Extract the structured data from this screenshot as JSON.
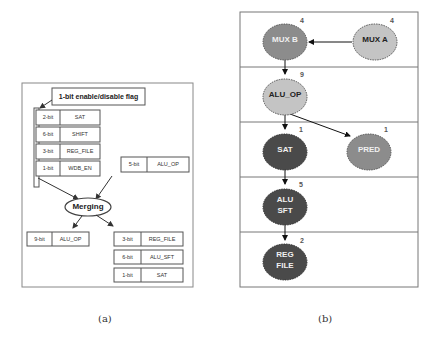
{
  "panel_a": {
    "caption": "(a)",
    "flag_label": "1-bit enable/disable flag",
    "inputs": [
      {
        "bits": "2-bit",
        "name": "SAT"
      },
      {
        "bits": "6-bit",
        "name": "SHIFT"
      },
      {
        "bits": "3-bit",
        "name": "REG_FILE"
      },
      {
        "bits": "1-bit",
        "name": "WDB_EN"
      }
    ],
    "side_input": {
      "bits": "5-bit",
      "name": "ALU_OP"
    },
    "merge_label": "Merging",
    "output_left": {
      "bits": "9-bit",
      "name": "ALU_OP"
    },
    "outputs_right": [
      {
        "bits": "3-bit",
        "name": "REG_FILE"
      },
      {
        "bits": "6-bit",
        "name": "ALU_SFT"
      },
      {
        "bits": "1-bit",
        "name": "SAT"
      }
    ]
  },
  "panel_b": {
    "caption": "(b)",
    "nodes": [
      {
        "id": "mux_b",
        "label": "MUX B",
        "weight": "4",
        "fill": "#8c8c8c",
        "text_color": "#f0f0f0"
      },
      {
        "id": "mux_a",
        "label": "MUX A",
        "weight": "4",
        "fill": "#c4c4c4",
        "text_color": "#222222"
      },
      {
        "id": "alu_op",
        "label": "ALU_OP",
        "weight": "9",
        "fill": "#c4c4c4",
        "text_color": "#222222"
      },
      {
        "id": "sat",
        "label": "SAT",
        "weight": "1",
        "fill": "#4a4a4a",
        "text_color": "#f0f0f0"
      },
      {
        "id": "pred",
        "label": "PRED",
        "weight": "1",
        "fill": "#8c8c8c",
        "text_color": "#f0f0f0"
      },
      {
        "id": "alu_sft_1",
        "label": "ALU",
        "label2": "SFT",
        "weight": "5",
        "fill": "#4a4a4a",
        "text_color": "#f0f0f0"
      },
      {
        "id": "reg_file_1",
        "label": "REG",
        "label2": "FILE",
        "weight": "2",
        "fill": "#4a4a4a",
        "text_color": "#f0f0f0"
      }
    ]
  }
}
